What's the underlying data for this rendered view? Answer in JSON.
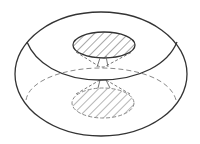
{
  "diagram": {
    "colors": {
      "background": "#ffffff",
      "stroke": "#333333",
      "dashed": "#8a8a8a",
      "hatch": "#555555"
    },
    "shapes": {
      "outer_silhouette": {
        "cx": 101,
        "cy": 74,
        "rx": 86,
        "ry": 62
      },
      "top_hatched_ellipse": {
        "cx": 104,
        "cy": 45,
        "rx": 31,
        "ry": 13
      },
      "bottom_hatched_ellipse": {
        "cx": 103,
        "cy": 103,
        "rx": 31,
        "ry": 15
      },
      "back_dashed_ellipse": {
        "cx": 100,
        "cy": 98,
        "rx": 76,
        "ry": 30
      }
    }
  }
}
